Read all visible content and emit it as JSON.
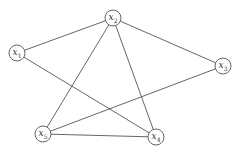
{
  "graph": {
    "nodes": [
      {
        "id": "x1",
        "name": "x",
        "sub": "1",
        "x": 17,
        "y": 53
      },
      {
        "id": "x2",
        "name": "x",
        "sub": "2",
        "x": 113,
        "y": 18
      },
      {
        "id": "x3",
        "name": "x",
        "sub": "3",
        "x": 223,
        "y": 66
      },
      {
        "id": "x4",
        "name": "x",
        "sub": "4",
        "x": 156,
        "y": 137
      },
      {
        "id": "x5",
        "name": "x",
        "sub": "5",
        "x": 43,
        "y": 134
      }
    ],
    "edges": [
      [
        "x1",
        "x2"
      ],
      [
        "x2",
        "x3"
      ],
      [
        "x2",
        "x5"
      ],
      [
        "x2",
        "x4"
      ],
      [
        "x1",
        "x4"
      ],
      [
        "x3",
        "x5"
      ],
      [
        "x5",
        "x4"
      ]
    ],
    "node_radius": 8,
    "stroke_color": "#555555"
  },
  "caption": ""
}
